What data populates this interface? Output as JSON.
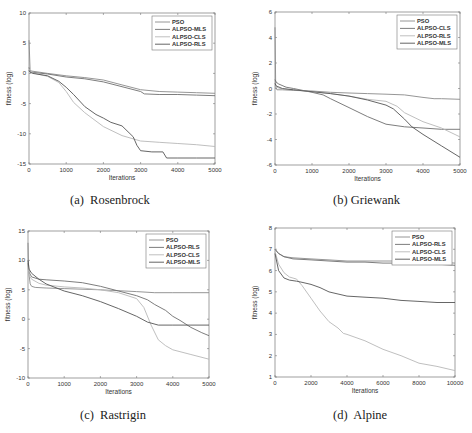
{
  "chart_data": [
    {
      "id": "a",
      "type": "line",
      "title": "",
      "caption": "(a)  Rosenbrock",
      "xlabel": "Iterations",
      "ylabel": "fitness (log)",
      "xlim": [
        0,
        5000
      ],
      "ylim": [
        -15,
        10
      ],
      "xticks": [
        0,
        1000,
        2000,
        3000,
        4000,
        5000
      ],
      "yticks": [
        -15,
        -10,
        -5,
        0,
        5,
        10
      ],
      "grid": false,
      "legend_position": "upper right",
      "legend": [
        "PSO",
        "ALPSO-MLS",
        "ALPSO-CLS",
        "ALPSO-RLS"
      ],
      "series": [
        {
          "name": "PSO",
          "color": "#8a8a8a",
          "x": [
            0,
            30,
            60,
            500,
            1000,
            1500,
            2000,
            2500,
            3000,
            3500,
            4000,
            4500,
            5000
          ],
          "y": [
            5.5,
            0.6,
            0.4,
            0.0,
            -0.4,
            -0.7,
            -1.1,
            -1.9,
            -2.7,
            -3.0,
            -3.1,
            -3.2,
            -3.3
          ]
        },
        {
          "name": "ALPSO-MLS",
          "color": "#6e6e6e",
          "x": [
            0,
            30,
            60,
            500,
            1000,
            1500,
            2000,
            2500,
            3000,
            3100,
            3500,
            4000,
            4500,
            5000
          ],
          "y": [
            1.0,
            0.3,
            0.2,
            -0.1,
            -0.6,
            -0.9,
            -1.4,
            -2.2,
            -3.0,
            -3.4,
            -3.5,
            -3.5,
            -3.6,
            -3.7
          ]
        },
        {
          "name": "ALPSO-CLS",
          "color": "#b8b8b8",
          "x": [
            0,
            30,
            100,
            500,
            800,
            1000,
            1200,
            1500,
            2000,
            2500,
            3000,
            3500,
            4000,
            4500,
            5000
          ],
          "y": [
            0.8,
            0.3,
            0.1,
            -0.5,
            -1.5,
            -3.0,
            -4.8,
            -6.5,
            -8.8,
            -10.3,
            -11.2,
            -11.4,
            -11.6,
            -11.8,
            -12.1
          ]
        },
        {
          "name": "ALPSO-RLS",
          "color": "#555555",
          "x": [
            0,
            30,
            100,
            500,
            800,
            1000,
            1200,
            1500,
            1800,
            2000,
            2200,
            2500,
            2800,
            2900,
            3000,
            3300,
            3600,
            3700,
            4000,
            4500,
            5000
          ],
          "y": [
            0.5,
            0.2,
            0.0,
            -0.4,
            -1.3,
            -2.3,
            -3.5,
            -5.5,
            -6.8,
            -7.4,
            -8.1,
            -8.7,
            -10.5,
            -11.9,
            -12.8,
            -13.0,
            -13.0,
            -14.0,
            -14.0,
            -14.0,
            -14.0
          ]
        }
      ],
      "frame": {
        "x0": 29,
        "x1": 215,
        "y0": 13,
        "y1": 164,
        "panel_left": 0,
        "panel_top": 0
      }
    },
    {
      "id": "b",
      "type": "line",
      "title": "",
      "caption": "(b) Griewank",
      "xlabel": "Iterations",
      "ylabel": "fitness (log)",
      "xlim": [
        0,
        5000
      ],
      "ylim": [
        -6,
        6
      ],
      "xticks": [
        0,
        1000,
        2000,
        3000,
        4000,
        5000
      ],
      "yticks": [
        -6,
        -4,
        -2,
        0,
        2,
        4,
        6
      ],
      "grid": false,
      "legend_position": "upper right",
      "legend": [
        "PSO",
        "ALPSO-CLS",
        "ALPSO-RLS",
        "ALPSO-MLS"
      ],
      "series": [
        {
          "name": "PSO",
          "color": "#8a8a8a",
          "x": [
            0,
            20,
            50,
            200,
            500,
            1000,
            1500,
            2000,
            2500,
            3000,
            3500,
            4000,
            4300,
            4500,
            5000
          ],
          "y": [
            4.8,
            0.1,
            -0.1,
            -0.1,
            -0.15,
            -0.2,
            -0.3,
            -0.35,
            -0.4,
            -0.45,
            -0.5,
            -0.7,
            -0.8,
            -0.8,
            -0.85
          ]
        },
        {
          "name": "ALPSO-CLS",
          "color": "#6e6e6e",
          "x": [
            0,
            30,
            100,
            300,
            500,
            1000,
            1300,
            1500,
            2000,
            2500,
            3000,
            3500,
            4000,
            4500,
            5000
          ],
          "y": [
            0.7,
            0.5,
            0.35,
            0.1,
            0.0,
            -0.3,
            -0.5,
            -0.8,
            -1.5,
            -2.2,
            -2.8,
            -3.0,
            -3.1,
            -3.2,
            -3.2
          ]
        },
        {
          "name": "ALPSO-RLS",
          "color": "#b8b8b8",
          "x": [
            0,
            30,
            200,
            500,
            1000,
            1500,
            2000,
            2500,
            3000,
            3300,
            3500,
            4000,
            4500,
            5000
          ],
          "y": [
            0.3,
            0.1,
            -0.05,
            -0.1,
            -0.25,
            -0.4,
            -0.6,
            -0.85,
            -1.0,
            -1.4,
            -1.9,
            -2.6,
            -3.1,
            -3.8
          ]
        },
        {
          "name": "ALPSO-MLS",
          "color": "#555555",
          "x": [
            0,
            30,
            200,
            500,
            1000,
            1500,
            2000,
            2500,
            3000,
            3200,
            3500,
            3700,
            4000,
            4500,
            5000
          ],
          "y": [
            0.4,
            0.2,
            0.0,
            -0.1,
            -0.25,
            -0.4,
            -0.6,
            -0.9,
            -1.3,
            -1.6,
            -2.4,
            -3.0,
            -3.6,
            -4.5,
            -5.4
          ]
        }
      ],
      "frame": {
        "x0": 39,
        "x1": 224,
        "y0": 12,
        "y1": 165,
        "panel_left": 236,
        "panel_top": 0
      }
    },
    {
      "id": "c",
      "type": "line",
      "title": "",
      "caption": "(c)  Rastrigin",
      "xlabel": "Iterations",
      "ylabel": "fitness (log)",
      "xlim": [
        0,
        5000
      ],
      "ylim": [
        -10,
        15
      ],
      "xticks": [
        0,
        1000,
        2000,
        3000,
        4000,
        5000
      ],
      "yticks": [
        -10,
        -5,
        0,
        5,
        10,
        15
      ],
      "grid": false,
      "legend_position": "upper right",
      "legend": [
        "PSO",
        "ALPSO-RLS",
        "ALPSO-CLS",
        "ALPSO-MLS"
      ],
      "series": [
        {
          "name": "PSO",
          "color": "#8a8a8a",
          "x": [
            0,
            20,
            60,
            100,
            200,
            500,
            1000,
            2000,
            3000,
            3500,
            4000,
            4500,
            5000
          ],
          "y": [
            13.0,
            8.0,
            6.0,
            5.6,
            5.4,
            5.3,
            5.2,
            5.0,
            4.7,
            4.5,
            4.5,
            4.5,
            4.5
          ]
        },
        {
          "name": "ALPSO-RLS",
          "color": "#6e6e6e",
          "x": [
            0,
            30,
            100,
            300,
            500,
            1000,
            1500,
            2000,
            2500,
            3000,
            3300,
            3500,
            3800,
            4000,
            4200,
            4500,
            4800,
            5000
          ],
          "y": [
            9.5,
            8.0,
            7.2,
            6.8,
            6.7,
            6.5,
            6.2,
            5.6,
            4.8,
            4.0,
            3.3,
            2.5,
            1.5,
            0.5,
            -0.2,
            -1.4,
            -2.3,
            -2.8
          ]
        },
        {
          "name": "ALPSO-CLS",
          "color": "#b8b8b8",
          "x": [
            0,
            30,
            100,
            300,
            500,
            1000,
            1500,
            2000,
            2500,
            3000,
            3200,
            3400,
            3600,
            3800,
            4000,
            4500,
            5000
          ],
          "y": [
            9.0,
            7.5,
            6.8,
            6.1,
            5.8,
            5.5,
            5.3,
            5.0,
            4.5,
            3.5,
            2.0,
            -1.0,
            -3.5,
            -4.5,
            -5.2,
            -6.0,
            -6.8
          ]
        },
        {
          "name": "ALPSO-MLS",
          "color": "#555555",
          "x": [
            0,
            30,
            100,
            300,
            500,
            1000,
            1500,
            2000,
            2500,
            3000,
            3300,
            3600,
            4000,
            4500,
            5000
          ],
          "y": [
            10.0,
            8.5,
            7.8,
            6.8,
            6.0,
            4.8,
            4.0,
            3.0,
            1.8,
            0.5,
            -0.5,
            -1.0,
            -1.0,
            -1.0,
            -1.0
          ]
        }
      ],
      "frame": {
        "x0": 28,
        "x1": 209,
        "y0": 15,
        "y1": 162,
        "panel_left": 0,
        "panel_top": 216
      }
    },
    {
      "id": "d",
      "type": "line",
      "title": "",
      "caption": "(d)  Alpine",
      "xlabel": "Iterations",
      "ylabel": "fitness (log)",
      "xlim": [
        0,
        10000
      ],
      "ylim": [
        1,
        8
      ],
      "xticks": [
        0,
        2000,
        4000,
        6000,
        8000,
        10000
      ],
      "yticks": [
        1,
        2,
        3,
        4,
        5,
        6,
        7,
        8
      ],
      "grid": false,
      "legend_position": "upper right",
      "legend": [
        "PSO",
        "ALPSO-RLS",
        "ALPSO-CLS",
        "ALPSO-MLS"
      ],
      "series": [
        {
          "name": "PSO",
          "color": "#8a8a8a",
          "x": [
            0,
            200,
            500,
            1000,
            2000,
            3000,
            4000,
            5000,
            6000,
            7000,
            8000,
            9000,
            10000
          ],
          "y": [
            7.0,
            6.8,
            6.65,
            6.6,
            6.55,
            6.5,
            6.45,
            6.45,
            6.45,
            6.45,
            6.4,
            6.4,
            6.35
          ]
        },
        {
          "name": "ALPSO-RLS",
          "color": "#6e6e6e",
          "x": [
            0,
            200,
            500,
            1000,
            2000,
            3000,
            4000,
            5000,
            6000,
            7000,
            8000,
            9000,
            10000
          ],
          "y": [
            7.0,
            6.8,
            6.65,
            6.55,
            6.5,
            6.45,
            6.4,
            6.4,
            6.35,
            6.35,
            6.3,
            6.3,
            6.25
          ]
        },
        {
          "name": "ALPSO-CLS",
          "color": "#b8b8b8",
          "x": [
            0,
            200,
            500,
            800,
            1200,
            1500,
            2000,
            2500,
            3000,
            3500,
            3800,
            4000,
            5000,
            6000,
            7000,
            8000,
            9000,
            10000
          ],
          "y": [
            6.9,
            6.3,
            5.9,
            5.7,
            5.6,
            5.3,
            4.7,
            4.1,
            3.6,
            3.3,
            3.05,
            3.0,
            2.7,
            2.3,
            2.0,
            1.65,
            1.5,
            1.3
          ]
        },
        {
          "name": "ALPSO-MLS",
          "color": "#555555",
          "x": [
            0,
            200,
            500,
            800,
            1200,
            1500,
            2000,
            2500,
            3000,
            3500,
            4000,
            5000,
            6000,
            7000,
            8000,
            9000,
            10000
          ],
          "y": [
            6.8,
            6.0,
            5.65,
            5.55,
            5.5,
            5.45,
            5.35,
            5.2,
            5.0,
            4.9,
            4.8,
            4.75,
            4.7,
            4.6,
            4.55,
            4.5,
            4.5
          ]
        }
      ],
      "frame": {
        "x0": 39,
        "x1": 219,
        "y0": 12,
        "y1": 161,
        "panel_left": 236,
        "panel_top": 216
      }
    }
  ]
}
